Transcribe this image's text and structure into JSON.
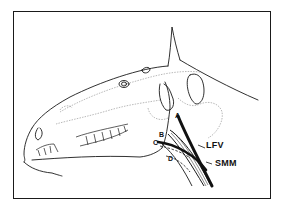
{
  "diagram": {
    "labels": {
      "A": "A",
      "B": "B",
      "C": "C",
      "D": "D",
      "LFV": "LFV",
      "SMM": "SMM"
    },
    "colors": {
      "ink": "#1a1a1a",
      "faint": "#8a8a8a",
      "background": "#ffffff"
    }
  }
}
